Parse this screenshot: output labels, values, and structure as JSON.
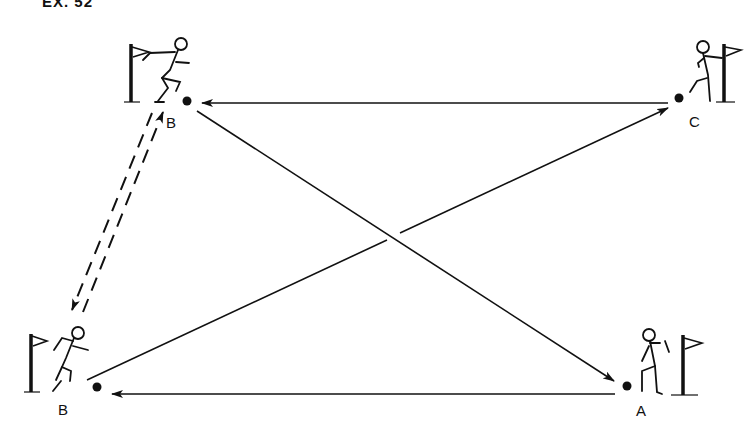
{
  "header": {
    "title": "EX. 52"
  },
  "stations": [
    {
      "id": "B-top",
      "label": "B",
      "ball": [
        187,
        101
      ]
    },
    {
      "id": "C",
      "label": "C",
      "ball": [
        679,
        98
      ]
    },
    {
      "id": "B-bottom",
      "label": "B",
      "ball": [
        97,
        387
      ]
    },
    {
      "id": "A",
      "label": "A",
      "ball": [
        627,
        386
      ]
    }
  ],
  "arrows": [
    {
      "from": "C",
      "to": "B-top",
      "style": "solid"
    },
    {
      "from": "B-top",
      "to": "A",
      "style": "solid"
    },
    {
      "from": "A",
      "to": "B-bottom",
      "style": "solid"
    },
    {
      "from": "B-bottom",
      "to": "C",
      "style": "solid"
    },
    {
      "from": "B-top",
      "to": "B-bottom",
      "style": "dashed"
    },
    {
      "from": "B-bottom",
      "to": "B-top",
      "style": "dashed"
    }
  ],
  "colors": {
    "ink": "#111111",
    "background": "#ffffff"
  }
}
